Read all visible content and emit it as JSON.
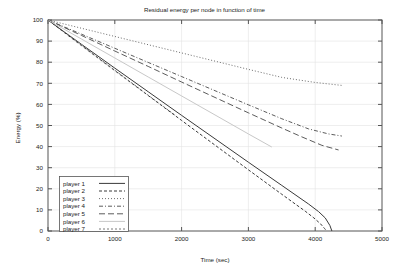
{
  "chart_data": {
    "type": "line",
    "title": "Residual energy per node in function of time",
    "xlabel": "Time (sec)",
    "ylabel": "Energy (%)",
    "xlim": [
      0,
      5000
    ],
    "ylim": [
      0,
      100
    ],
    "xticks": [
      0,
      1000,
      2000,
      3000,
      4000,
      5000
    ],
    "yticks": [
      0,
      10,
      20,
      30,
      40,
      50,
      60,
      70,
      80,
      90,
      100
    ],
    "xtick_labels": [
      "0",
      "1000",
      "2000",
      "3000",
      "4000",
      "5000"
    ],
    "ytick_labels": [
      "0",
      "10",
      "20",
      "30",
      "40",
      "50",
      "60",
      "70",
      "80",
      "90",
      "100"
    ],
    "grid": true,
    "grid_axis": "y",
    "legend_position": "lower-left-inside",
    "legend_boxed": true,
    "series": [
      {
        "name": "player 1",
        "style": "solid",
        "color": "#3a3a3a",
        "width": 1.0,
        "x": [
          0,
          250,
          500,
          1000,
          1500,
          2000,
          2500,
          3000,
          3500,
          3900,
          4050,
          4150,
          4220,
          4250
        ],
        "y": [
          100,
          94.2,
          88.5,
          77.2,
          66.0,
          54.8,
          43.7,
          32.6,
          21.6,
          12.8,
          9.2,
          6.2,
          2.6,
          0
        ]
      },
      {
        "name": "player 2",
        "style": "dashed",
        "color": "#3a3a3a",
        "width": 1.0,
        "x": [
          0,
          250,
          500,
          1000,
          1500,
          2000,
          2500,
          3000,
          3500,
          3850,
          3980,
          4080,
          4140,
          4170
        ],
        "y": [
          100,
          93.9,
          87.9,
          76.0,
          64.2,
          52.4,
          40.7,
          29.0,
          17.4,
          9.4,
          6.2,
          3.4,
          1.2,
          0
        ]
      },
      {
        "name": "player 3",
        "style": "dotted",
        "color": "#5a5a5a",
        "width": 0.9,
        "x": [
          0,
          500,
          1000,
          1500,
          2000,
          2500,
          3000,
          3500,
          4000,
          4400
        ],
        "y": [
          100,
          96.1,
          92.2,
          88.3,
          84.4,
          80.5,
          76.6,
          72.8,
          70.4,
          69.0
        ]
      },
      {
        "name": "player 4",
        "style": "dashdot",
        "color": "#4a4a4a",
        "width": 0.9,
        "x": [
          0,
          500,
          1000,
          1500,
          2000,
          2500,
          3000,
          3500,
          3900,
          4200,
          4400
        ],
        "y": [
          100,
          93.3,
          86.6,
          79.9,
          73.2,
          66.5,
          59.8,
          53.2,
          48.4,
          46.0,
          45.0
        ]
      },
      {
        "name": "player 5",
        "style": "longdash",
        "color": "#4a4a4a",
        "width": 0.9,
        "x": [
          0,
          500,
          1000,
          1500,
          2000,
          2500,
          3000,
          3500,
          3800,
          4100,
          4350
        ],
        "y": [
          100,
          92.7,
          85.3,
          78.0,
          70.6,
          63.3,
          56.0,
          48.8,
          44.6,
          40.6,
          38.4
        ]
      },
      {
        "name": "player 6",
        "style": "solid-light",
        "color": "#c8c8c8",
        "width": 1.0,
        "x": [
          0,
          500,
          1000,
          1500,
          2000,
          2500,
          3000,
          3350
        ],
        "y": [
          100,
          91.0,
          82.0,
          73.0,
          64.0,
          55.0,
          46.0,
          39.8
        ]
      },
      {
        "name": "player 7",
        "style": "shortdash",
        "color": "#6a6a6a",
        "width": 0.9,
        "x": [
          0,
          400,
          800,
          1200,
          1600,
          1900
        ],
        "y": [
          100,
          90.5,
          81.0,
          71.5,
          62.0,
          55.0
        ]
      }
    ]
  },
  "legend": {
    "entries": [
      {
        "label": "player 1"
      },
      {
        "label": "player 2"
      },
      {
        "label": "player 3"
      },
      {
        "label": "player 4"
      },
      {
        "label": "player 5"
      },
      {
        "label": "player 6"
      },
      {
        "label": "player 7"
      }
    ]
  }
}
